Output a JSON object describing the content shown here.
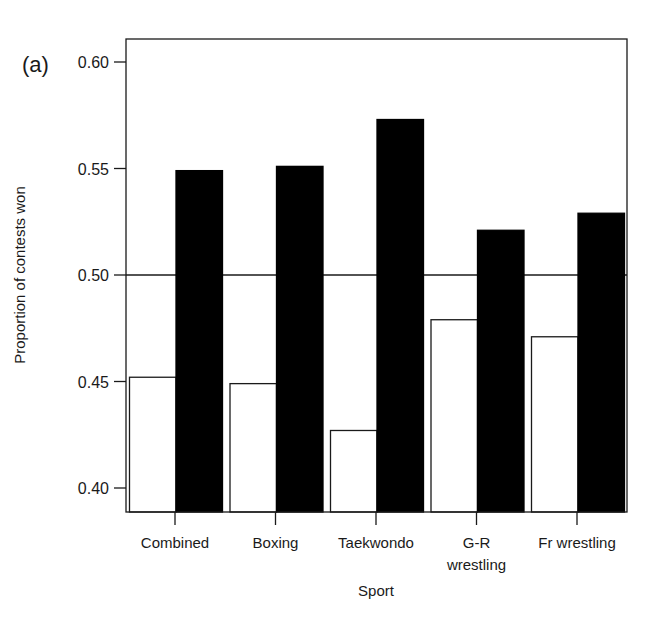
{
  "panel_label": "(a)",
  "chart_data": {
    "type": "bar",
    "title": "",
    "panel_label": "(a)",
    "xlabel": "Sport",
    "ylabel": "Proportion of contests won",
    "ylim": [
      0.389,
      0.611
    ],
    "yticks": [
      0.4,
      0.45,
      0.5,
      0.55,
      0.6
    ],
    "ytick_labels": [
      "0.40",
      "0.45",
      "0.50",
      "0.55",
      "0.60"
    ],
    "reference_line": 0.5,
    "grid": false,
    "legend": null,
    "categories": [
      "Combined",
      "Boxing",
      "Taekwondo",
      "G-R wrestling",
      "Fr wrestling"
    ],
    "category_label_lines": [
      [
        "Combined"
      ],
      [
        "Boxing"
      ],
      [
        "Taekwondo"
      ],
      [
        "G-R",
        "wrestling"
      ],
      [
        "Fr wrestling"
      ]
    ],
    "series": [
      {
        "name": "white bars",
        "fill": "#ffffff",
        "stroke": "#1a1a1a",
        "values": [
          0.452,
          0.449,
          0.427,
          0.479,
          0.471
        ]
      },
      {
        "name": "black bars",
        "fill": "#000000",
        "stroke": "#000000",
        "values": [
          0.549,
          0.551,
          0.573,
          0.521,
          0.529
        ]
      }
    ]
  }
}
